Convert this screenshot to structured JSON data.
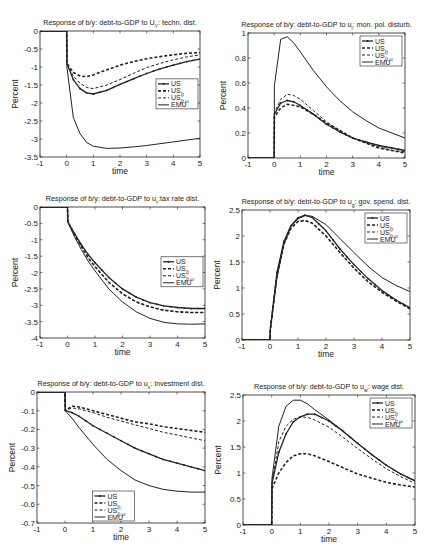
{
  "figure": {
    "width": 435,
    "height": 557,
    "line_color": "#222222",
    "background": "#ffffff"
  },
  "legend_entries": [
    {
      "label": "US",
      "sub": "",
      "style": "solid-marker"
    },
    {
      "label": "US",
      "sub": "ξt",
      "style": "dash-dot-heavy"
    },
    {
      "label": "US",
      "sub": "ξt,ω",
      "style": "dashed"
    },
    {
      "label": "EMU",
      "sub": "",
      "style": "solid"
    }
  ],
  "chart_data": [
    {
      "id": "techn",
      "type": "line",
      "title": "Response of b/y: debt-to-GDP to U",
      "title_sub": "Y",
      "title_suffix": ": techn. dist.",
      "xlabel": "time",
      "ylabel": "Percent",
      "xlim": [
        -1,
        5
      ],
      "ylim": [
        -3.5,
        0
      ],
      "xticks": [
        "-1",
        "0",
        "1",
        "2",
        "3",
        "4",
        "5"
      ],
      "yticks": [
        "0",
        "-0.5",
        "-1",
        "-1.5",
        "-2",
        "-2.5",
        "-3",
        "-3.5"
      ],
      "legend_position": "right-middle",
      "box": {
        "x": 40,
        "y": 31,
        "w": 160,
        "h": 126
      },
      "x": [
        -1,
        -0.5,
        0,
        0.01,
        0.25,
        0.5,
        0.75,
        1,
        1.5,
        2,
        2.5,
        3,
        3.5,
        4,
        4.5,
        5
      ],
      "series": [
        {
          "name": "US",
          "values": [
            0,
            0,
            0,
            -0.9,
            -1.35,
            -1.6,
            -1.72,
            -1.75,
            -1.65,
            -1.48,
            -1.33,
            -1.18,
            -1.05,
            -0.95,
            -0.85,
            -0.78
          ]
        },
        {
          "name": "USξt",
          "values": [
            0,
            0,
            0,
            -0.9,
            -1.15,
            -1.25,
            -1.27,
            -1.22,
            -1.08,
            -0.95,
            -0.85,
            -0.77,
            -0.71,
            -0.66,
            -0.62,
            -0.6
          ]
        },
        {
          "name": "USξt,ω",
          "values": [
            0,
            0,
            0,
            -0.92,
            -1.25,
            -1.45,
            -1.57,
            -1.6,
            -1.5,
            -1.35,
            -1.18,
            -1.02,
            -0.9,
            -0.8,
            -0.72,
            -0.66
          ]
        },
        {
          "name": "EMU",
          "values": [
            0,
            0,
            0,
            -1.0,
            -2.4,
            -2.85,
            -3.1,
            -3.2,
            -3.26,
            -3.25,
            -3.22,
            -3.18,
            -3.13,
            -3.08,
            -3.03,
            -2.98
          ]
        }
      ]
    },
    {
      "id": "monpol",
      "type": "line",
      "title": "Response of b/y: debt-to-GDP to u",
      "title_sub": "i",
      "title_suffix": ": mon. pol. disturb.",
      "xlabel": "time",
      "ylabel": "Percent",
      "xlim": [
        -1,
        5
      ],
      "ylim": [
        0,
        1
      ],
      "xticks": [
        "-1",
        "0",
        "1",
        "2",
        "3",
        "4",
        "5"
      ],
      "yticks": [
        "0",
        "0.2",
        "0.4",
        "0.6",
        "0.8",
        "1"
      ],
      "legend_position": "top-right",
      "box": {
        "x": 248,
        "y": 33,
        "w": 157,
        "h": 125
      },
      "x": [
        -1,
        -0.5,
        0,
        0.01,
        0.25,
        0.5,
        0.75,
        1,
        1.5,
        2,
        2.5,
        3,
        3.5,
        4,
        4.5,
        5
      ],
      "series": [
        {
          "name": "US",
          "values": [
            0,
            0,
            0,
            0.35,
            0.44,
            0.46,
            0.45,
            0.42,
            0.35,
            0.27,
            0.21,
            0.16,
            0.13,
            0.1,
            0.08,
            0.06
          ]
        },
        {
          "name": "USξt",
          "values": [
            0,
            0,
            0,
            0.33,
            0.4,
            0.43,
            0.42,
            0.41,
            0.35,
            0.28,
            0.22,
            0.16,
            0.12,
            0.08,
            0.06,
            0.04
          ]
        },
        {
          "name": "USξt,ω",
          "values": [
            0,
            0,
            0,
            0.36,
            0.47,
            0.51,
            0.5,
            0.47,
            0.38,
            0.29,
            0.22,
            0.16,
            0.12,
            0.09,
            0.06,
            0.05
          ]
        },
        {
          "name": "EMU",
          "values": [
            0,
            0,
            0,
            0.58,
            0.95,
            0.97,
            0.92,
            0.85,
            0.7,
            0.57,
            0.46,
            0.37,
            0.3,
            0.24,
            0.2,
            0.16
          ]
        }
      ]
    },
    {
      "id": "taxrate",
      "type": "line",
      "title": "Response of b/y: debt-to-GDP to u",
      "title_sub": "τ",
      "title_suffix": ":tax rate dist.",
      "xlabel": "time",
      "ylabel": "Percent",
      "xlim": [
        -1,
        5
      ],
      "ylim": [
        -4,
        0
      ],
      "xticks": [
        "-1",
        "0",
        "1",
        "2",
        "3",
        "4",
        "5"
      ],
      "yticks": [
        "0",
        "-0.5",
        "-1",
        "-1.5",
        "-2",
        "-2.5",
        "-3",
        "-3.5",
        "-4"
      ],
      "legend_position": "right-middle",
      "box": {
        "x": 40,
        "y": 207,
        "w": 165,
        "h": 131
      },
      "x": [
        -1,
        -0.5,
        0,
        0.01,
        0.25,
        0.5,
        0.75,
        1,
        1.5,
        2,
        2.5,
        3,
        3.5,
        4,
        4.5,
        5
      ],
      "series": [
        {
          "name": "US",
          "values": [
            0,
            0,
            0,
            -0.45,
            -0.8,
            -1.15,
            -1.45,
            -1.7,
            -2.15,
            -2.5,
            -2.75,
            -2.92,
            -3.02,
            -3.07,
            -3.1,
            -3.1
          ]
        },
        {
          "name": "USξt",
          "values": [
            0,
            0,
            0,
            -0.45,
            -0.85,
            -1.2,
            -1.55,
            -1.82,
            -2.3,
            -2.65,
            -2.9,
            -3.05,
            -3.15,
            -3.2,
            -3.22,
            -3.22
          ]
        },
        {
          "name": "USξt,ω",
          "values": [
            0,
            0,
            0,
            -0.45,
            -0.85,
            -1.2,
            -1.55,
            -1.82,
            -2.3,
            -2.65,
            -2.9,
            -3.05,
            -3.15,
            -3.2,
            -3.22,
            -3.22
          ]
        },
        {
          "name": "EMU",
          "values": [
            0,
            0,
            0,
            -0.45,
            -0.9,
            -1.3,
            -1.65,
            -1.95,
            -2.5,
            -2.9,
            -3.2,
            -3.4,
            -3.52,
            -3.57,
            -3.58,
            -3.57
          ]
        }
      ]
    },
    {
      "id": "govspend",
      "type": "line",
      "title": "Response of b/y: debt-to-GDP to u",
      "title_sub": "g",
      "title_suffix": ": gov. spend. dist.",
      "xlabel": "time",
      "ylabel": "Percent",
      "xlim": [
        -1,
        5
      ],
      "ylim": [
        0,
        2.5
      ],
      "xticks": [
        "-1",
        "0",
        "1",
        "2",
        "3",
        "4",
        "5"
      ],
      "yticks": [
        "0",
        "0.5",
        "1",
        "1.5",
        "2",
        "2.5"
      ],
      "legend_position": "top-right",
      "box": {
        "x": 242,
        "y": 210,
        "w": 168,
        "h": 130
      },
      "x": [
        -1,
        -0.5,
        0,
        0.01,
        0.25,
        0.5,
        0.75,
        1,
        1.25,
        1.5,
        2,
        2.5,
        3,
        3.5,
        4,
        4.5,
        5
      ],
      "series": [
        {
          "name": "US",
          "values": [
            0,
            0,
            0,
            0.2,
            1.3,
            1.9,
            2.2,
            2.35,
            2.4,
            2.36,
            2.1,
            1.75,
            1.45,
            1.18,
            0.95,
            0.77,
            0.62
          ]
        },
        {
          "name": "USξt",
          "values": [
            0,
            0,
            0,
            0.2,
            1.25,
            1.85,
            2.15,
            2.28,
            2.3,
            2.25,
            2.0,
            1.68,
            1.38,
            1.12,
            0.92,
            0.75,
            0.6
          ]
        },
        {
          "name": "USξt,ω",
          "values": [
            0,
            0,
            0,
            0.2,
            1.25,
            1.85,
            2.15,
            2.28,
            2.3,
            2.25,
            2.0,
            1.68,
            1.38,
            1.12,
            0.92,
            0.75,
            0.6
          ]
        },
        {
          "name": "EMU",
          "values": [
            0,
            0,
            0,
            0.2,
            1.2,
            1.85,
            2.18,
            2.33,
            2.39,
            2.38,
            2.22,
            1.95,
            1.68,
            1.42,
            1.2,
            1.05,
            0.93
          ]
        }
      ]
    },
    {
      "id": "investment",
      "type": "line",
      "title": "Response of b/y: debt-to-GDP to u",
      "title_sub": "x",
      "title_suffix": ": Investment dist.",
      "xlabel": "time",
      "ylabel": "Percent",
      "xlim": [
        -1,
        5
      ],
      "ylim": [
        -0.7,
        0
      ],
      "xticks": [
        "-1",
        "0",
        "1",
        "2",
        "3",
        "4",
        "5"
      ],
      "yticks": [
        "0",
        "-0.1",
        "-0.2",
        "-0.3",
        "-0.4",
        "-0.5",
        "-0.6",
        "-0.7"
      ],
      "legend_position": "bottom-left",
      "box": {
        "x": 37,
        "y": 392,
        "w": 168,
        "h": 131
      },
      "x": [
        -1,
        -0.5,
        0,
        0.01,
        0.25,
        0.5,
        1,
        1.5,
        2,
        2.5,
        3,
        3.5,
        4,
        4.5,
        5
      ],
      "series": [
        {
          "name": "US",
          "values": [
            0,
            0,
            0,
            -0.1,
            -0.11,
            -0.13,
            -0.18,
            -0.22,
            -0.26,
            -0.3,
            -0.33,
            -0.36,
            -0.38,
            -0.4,
            -0.42
          ]
        },
        {
          "name": "USξt",
          "values": [
            0,
            0,
            0,
            -0.1,
            -0.075,
            -0.08,
            -0.1,
            -0.12,
            -0.14,
            -0.16,
            -0.17,
            -0.185,
            -0.195,
            -0.205,
            -0.215
          ]
        },
        {
          "name": "USξt,ω",
          "values": [
            0,
            0,
            0,
            -0.1,
            -0.085,
            -0.09,
            -0.11,
            -0.135,
            -0.155,
            -0.175,
            -0.195,
            -0.215,
            -0.23,
            -0.245,
            -0.26
          ]
        },
        {
          "name": "EMU",
          "values": [
            0,
            0,
            0,
            -0.1,
            -0.14,
            -0.19,
            -0.28,
            -0.36,
            -0.42,
            -0.47,
            -0.5,
            -0.52,
            -0.53,
            -0.535,
            -0.535
          ]
        }
      ]
    },
    {
      "id": "wage",
      "type": "line",
      "title": "Response of b/y: debt-to-GDP to u",
      "title_sub": "w",
      "title_suffix": ": wage dist.",
      "xlabel": "time",
      "ylabel": "Percent",
      "xlim": [
        -1,
        5
      ],
      "ylim": [
        0,
        2.5
      ],
      "xticks": [
        "-1",
        "0",
        "1",
        "2",
        "3",
        "4",
        "5"
      ],
      "yticks": [
        "0",
        "0.5",
        "1",
        "1.5",
        "2",
        "2.5"
      ],
      "legend_position": "top-right",
      "box": {
        "x": 243,
        "y": 395,
        "w": 172,
        "h": 130
      },
      "x": [
        -1,
        -0.5,
        0,
        0.01,
        0.25,
        0.5,
        0.75,
        1,
        1.25,
        1.5,
        2,
        2.5,
        3,
        3.5,
        4,
        4.5,
        5
      ],
      "series": [
        {
          "name": "US",
          "values": [
            0,
            0,
            0,
            0.8,
            1.4,
            1.75,
            1.98,
            2.08,
            2.13,
            2.13,
            2.0,
            1.8,
            1.57,
            1.35,
            1.15,
            0.98,
            0.85
          ]
        },
        {
          "name": "USξt",
          "values": [
            0,
            0,
            0,
            0.7,
            1.0,
            1.2,
            1.33,
            1.37,
            1.37,
            1.33,
            1.22,
            1.1,
            0.98,
            0.9,
            0.82,
            0.77,
            0.73
          ]
        },
        {
          "name": "USξt,ω",
          "values": [
            0,
            0,
            0,
            0.8,
            1.6,
            1.9,
            2.03,
            2.08,
            2.07,
            2.02,
            1.88,
            1.68,
            1.47,
            1.27,
            1.08,
            0.93,
            0.8
          ]
        },
        {
          "name": "EMU",
          "values": [
            0,
            0,
            0,
            0.9,
            1.9,
            2.28,
            2.4,
            2.4,
            2.33,
            2.22,
            2.02,
            1.8,
            1.57,
            1.35,
            1.15,
            0.98,
            0.85
          ]
        }
      ]
    }
  ]
}
